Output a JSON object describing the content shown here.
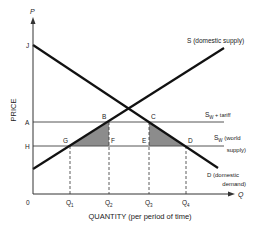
{
  "axes": {
    "y_symbol": "P",
    "x_symbol": "Q",
    "y_label": "PRICE",
    "x_label": "QUANTITY (per period of time)",
    "origin": "0"
  },
  "price_levels": {
    "J": "J",
    "A": "A",
    "H": "H"
  },
  "points": {
    "B": "B",
    "C": "C",
    "D": "D",
    "E": "E",
    "F": "F",
    "G": "G"
  },
  "quantities": {
    "q1": "Q",
    "q1_sub": "1",
    "q2": "Q",
    "q2_sub": "2",
    "q3": "Q",
    "q3_sub": "3",
    "q4": "Q",
    "q4_sub": "4"
  },
  "curves": {
    "supply": "S (domestic supply)",
    "tariff_main": "S",
    "tariff_sub": "W",
    "tariff_rest": " + tariff",
    "world_main": "S",
    "world_sub": "W",
    "world_rest": " (world",
    "world_line2": "supply)",
    "demand_line1": "D (domestic",
    "demand_line2": "demand)"
  },
  "colors": {
    "curve": "#111111",
    "axis": "#333333",
    "shade": "#8c8c8c",
    "grid": "#555555"
  }
}
